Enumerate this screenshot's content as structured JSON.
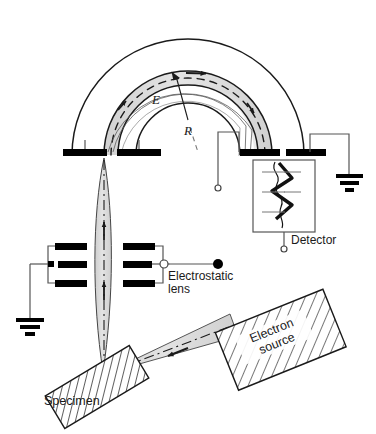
{
  "figure": {
    "background_color": "#ffffff",
    "ink_color": "#1a1a1a",
    "beam_fill_color": "#d8d8d8",
    "plate_color": "#000000"
  },
  "labels": {
    "field_symbol": "E",
    "radius_symbol": "R",
    "detector": "Detector",
    "electrostatic_lens_line1": "Electrostatic",
    "electrostatic_lens_line2": "lens",
    "electron_source_line1": "Electron",
    "electron_source_line2": "source",
    "specimen": "Specimen"
  },
  "components": [
    {
      "name": "outer-hemisphere",
      "kind": "arc"
    },
    {
      "name": "inner-hemisphere",
      "kind": "arc"
    },
    {
      "name": "electron-trajectory-band",
      "kind": "shaded-arc-band"
    },
    {
      "name": "entrance-slit-plates",
      "kind": "electrode-pair"
    },
    {
      "name": "exit-slit-plates",
      "kind": "electrode-pair"
    },
    {
      "name": "electrostatic-lens-electrodes",
      "kind": "electrode-stack"
    },
    {
      "name": "detector-multiplier",
      "kind": "channeltron"
    },
    {
      "name": "electron-source-block",
      "kind": "hatched-block"
    },
    {
      "name": "specimen-block",
      "kind": "hatched-block"
    },
    {
      "name": "ground-left",
      "kind": "ground-symbol"
    },
    {
      "name": "ground-right",
      "kind": "ground-symbol"
    },
    {
      "name": "terminal-inner-hemisphere",
      "kind": "open-terminal"
    },
    {
      "name": "terminal-detector",
      "kind": "open-terminal"
    },
    {
      "name": "terminal-lens",
      "kind": "filled-terminal"
    }
  ]
}
